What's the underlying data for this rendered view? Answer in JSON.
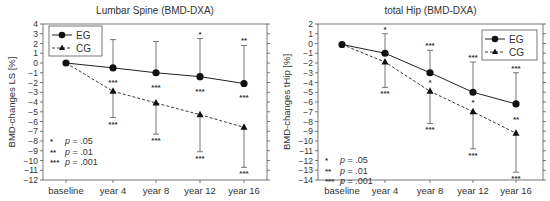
{
  "chart_data": [
    {
      "type": "line",
      "title": "Lumbar Spine (BMD-DXA)",
      "xlabel": "",
      "ylabel": "BMD-changes LS [%]",
      "ylim": [
        -12,
        4
      ],
      "yticks": [
        4,
        3,
        2,
        1,
        0,
        -1,
        -2,
        -3,
        -4,
        -5,
        -6,
        -7,
        -8,
        -9,
        -10,
        -11,
        -12
      ],
      "categories": [
        "baseline",
        "year 4",
        "year 8",
        "year 12",
        "year 16"
      ],
      "grid": false,
      "legend_position": "upper left",
      "series": [
        {
          "name": "EG",
          "marker": "circle",
          "linestyle": "solid",
          "values": [
            0,
            -0.5,
            -1.0,
            -1.4,
            -2.1
          ],
          "error_upper": [
            null,
            2.4,
            2.2,
            2.5,
            1.8
          ],
          "significance_upper": [
            "",
            "",
            "",
            "*",
            "**"
          ],
          "significance_below": [
            "",
            "***",
            "***",
            "***",
            "***"
          ]
        },
        {
          "name": "CG",
          "marker": "triangle",
          "linestyle": "dashed",
          "values": [
            0,
            -2.9,
            -4.1,
            -5.3,
            -6.6
          ],
          "error_lower": [
            null,
            -5.6,
            -7.3,
            -9.1,
            -10.7
          ],
          "significance_lower": [
            "",
            "***",
            "***",
            "***",
            "***"
          ]
        }
      ],
      "annotations": [
        "*   p = .05",
        "**  p = .01",
        "*** p = .001"
      ]
    },
    {
      "type": "line",
      "title": "total Hip (BMD-DXA)",
      "xlabel": "",
      "ylabel": "BMD-changes tHip [%]",
      "ylim": [
        -14,
        2
      ],
      "yticks": [
        2,
        1,
        0,
        -1,
        -2,
        -3,
        -4,
        -5,
        -6,
        -7,
        -8,
        -9,
        -10,
        -11,
        -12,
        -13,
        -14
      ],
      "categories": [
        "baseline",
        "year 4",
        "year 8",
        "year 12",
        "year 16"
      ],
      "grid": false,
      "legend_position": "upper right",
      "series": [
        {
          "name": "EG",
          "marker": "circle",
          "linestyle": "solid",
          "values": [
            -0.1,
            -1.0,
            -3.0,
            -5.0,
            -6.2
          ],
          "error_upper": [
            null,
            1.0,
            -0.7,
            -1.9,
            -3.0
          ],
          "significance_upper": [
            "",
            "*",
            "***",
            "***",
            "***"
          ],
          "significance_below": [
            "",
            "",
            "*",
            "*",
            "**"
          ]
        },
        {
          "name": "CG",
          "marker": "triangle",
          "linestyle": "dashed",
          "values": [
            -0.1,
            -1.9,
            -4.9,
            -7.0,
            -9.2
          ],
          "error_lower": [
            null,
            -4.5,
            -8.2,
            -10.8,
            -13.2
          ],
          "significance_lower": [
            "",
            "***",
            "***",
            "***",
            "***"
          ]
        }
      ],
      "annotations": [
        "*   p = .05",
        "**  p = .01",
        "*** p = .001"
      ]
    }
  ],
  "charts": [
    {
      "title": "Lumbar Spine (BMD-DXA)",
      "ylabel": "BMD-changes LS [%]",
      "legend": {
        "eg": "EG",
        "cg": "CG"
      },
      "notes": [
        {
          "stars": "*",
          "p": "p = .05"
        },
        {
          "stars": "**",
          "p": "p = .01"
        },
        {
          "stars": "***",
          "p": "p = .001"
        }
      ]
    },
    {
      "title": "total Hip (BMD-DXA)",
      "ylabel": "BMD-changes tHip [%]",
      "legend": {
        "eg": "EG",
        "cg": "CG"
      },
      "notes": [
        {
          "stars": "*",
          "p": "p = .05"
        },
        {
          "stars": "**",
          "p": "p = .01"
        },
        {
          "stars": "***",
          "p": "p = .001"
        }
      ]
    }
  ]
}
